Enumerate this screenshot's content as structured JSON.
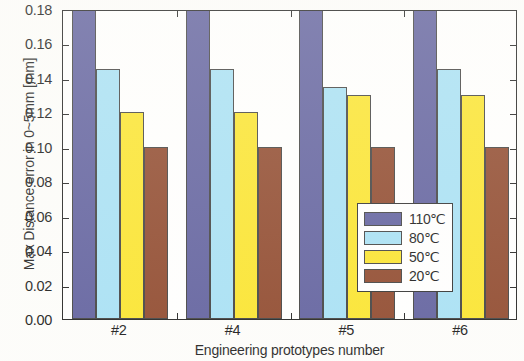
{
  "chart_data": {
    "type": "bar",
    "title": "",
    "xlabel": "Engineering prototypes number",
    "ylabel": "Max Distance error in 0~5mm [mm]",
    "categories": [
      "#2",
      "#4",
      "#5",
      "#6"
    ],
    "ylim": [
      0.0,
      0.18
    ],
    "ytick_labels": [
      "0.00",
      "0.02",
      "0.04",
      "0.06",
      "0.08",
      "0.10",
      "0.12",
      "0.14",
      "0.16",
      "0.18"
    ],
    "ytick_values": [
      0.0,
      0.02,
      0.04,
      0.06,
      0.08,
      0.1,
      0.12,
      0.14,
      0.16,
      0.18
    ],
    "grid": false,
    "legend_position": "lower right",
    "note": "110℃ bars exceed the 0.18 axis maximum and are clipped at the top of the plot",
    "series": [
      {
        "name": "110℃",
        "color": "#5c5c9c",
        "values": [
          0.185,
          0.185,
          0.185,
          0.185
        ],
        "clipped": true
      },
      {
        "name": "80℃",
        "color": "#a5e0f5",
        "values": [
          0.145,
          0.145,
          0.135,
          0.145
        ],
        "clipped": false
      },
      {
        "name": "50℃",
        "color": "#fbe428",
        "values": [
          0.12,
          0.12,
          0.13,
          0.13
        ],
        "clipped": false
      },
      {
        "name": "20℃",
        "color": "#8c4327",
        "values": [
          0.1,
          0.1,
          0.1,
          0.1
        ],
        "clipped": false
      }
    ]
  },
  "axes": {
    "frame_color": "#1c1c1c",
    "background": "#ffffff"
  }
}
